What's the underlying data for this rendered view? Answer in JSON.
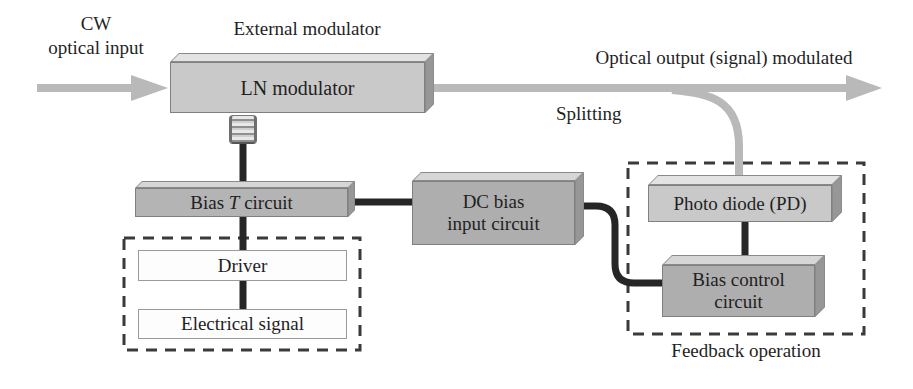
{
  "labels": {
    "cw_input_line1": "CW",
    "cw_input_line2": "optical input",
    "external_modulator": "External modulator",
    "optical_output": "Optical output (signal) modulated",
    "splitting": "Splitting",
    "feedback_operation": "Feedback operation"
  },
  "boxes": {
    "ln_modulator": "LN modulator",
    "bias_t": {
      "pre": "Bias ",
      "t": "T",
      "post": " circuit"
    },
    "dc_bias_line1": "DC bias",
    "dc_bias_line2": "input circuit",
    "photo_diode": "Photo diode (PD)",
    "bias_control_line1": "Bias control",
    "bias_control_line2": "circuit",
    "driver": "Driver",
    "electrical_signal": "Electrical signal"
  },
  "colors": {
    "ink": "#1f1f1f",
    "wire": "#262626",
    "arrow": "#b9b9b9",
    "dash": "#3a3a3a",
    "face_light": "#c9c9c9",
    "face_mid": "#b4b4b4",
    "face_dark": "#aeaeae",
    "bevel_light": "#e3e3e3",
    "bevel_mid": "#d6d6d6",
    "bevel_side": "#979797",
    "white_box": "#fdfdfd",
    "bg": "#ffffff"
  }
}
